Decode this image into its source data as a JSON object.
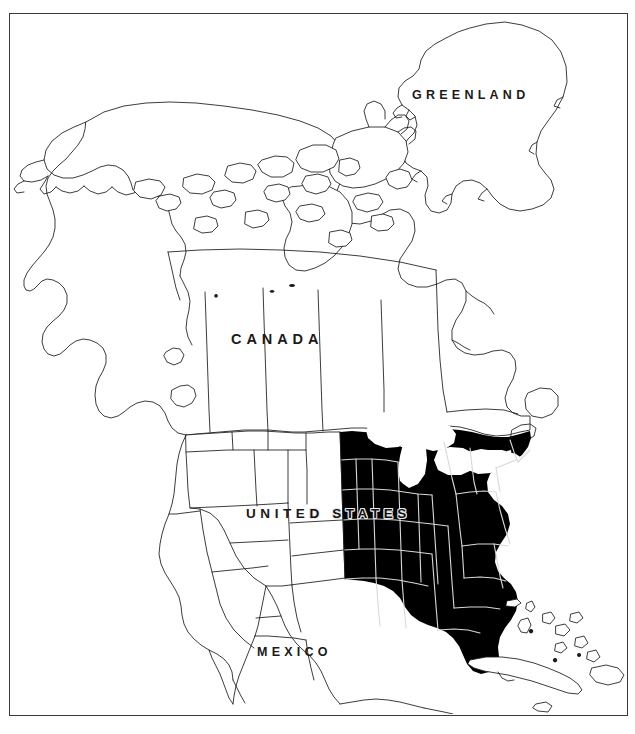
{
  "figure": {
    "kind": "distribution-range-map",
    "background_color": "#ffffff",
    "ink_color": "#1a1a1a",
    "frame": {
      "border_color": "#3a3a3a",
      "border_width_px": 1.6,
      "x": 9,
      "y": 13,
      "width": 619,
      "height": 703
    }
  },
  "labels": {
    "greenland": "GREENLAND",
    "canada": "CANADA",
    "mexico": "MEXICO",
    "united_states_full": "UNITED STATES",
    "united_states_left": "UNITE",
    "united_states_right": "D STATES"
  },
  "legend": {
    "shaded_fill_color": "#000000",
    "shaded_meaning": "range / distribution area",
    "unshaded_fill_color": "#ffffff",
    "boundary_line_color": "#1a1a1a"
  },
  "map_data": {
    "projection": "conic",
    "countries_outlined": [
      "Canada",
      "United States",
      "Mexico",
      "Greenland",
      "Cuba",
      "Bahamas"
    ],
    "internal_boundaries": [
      "Canadian provinces",
      "United States states",
      "Mexican northern states"
    ],
    "shaded_region_description": "Eastern and south-central United States, solid black",
    "shaded_states": [
      "Maine",
      "New Hampshire",
      "Vermont",
      "Massachusetts",
      "Rhode Island",
      "Connecticut",
      "New York",
      "New Jersey",
      "Pennsylvania",
      "Delaware",
      "Maryland",
      "Virginia",
      "West Virginia",
      "North Carolina",
      "South Carolina",
      "Georgia",
      "Florida",
      "Alabama",
      "Mississippi",
      "Tennessee",
      "Kentucky",
      "Ohio",
      "Indiana",
      "Illinois",
      "Wisconsin",
      "Iowa",
      "Missouri",
      "Arkansas",
      "Louisiana",
      "Texas",
      "Oklahoma"
    ],
    "unshaded_states": [
      "Alaska",
      "Washington",
      "Oregon",
      "California",
      "Nevada",
      "Idaho",
      "Montana",
      "Wyoming",
      "Utah",
      "Arizona",
      "Colorado",
      "New Mexico",
      "North Dakota",
      "South Dakota",
      "Nebraska",
      "Kansas",
      "Minnesota",
      "Michigan"
    ],
    "water_features": [
      "Hudson Bay",
      "Great Lakes",
      "Gulf of Mexico",
      "Atlantic Ocean",
      "Pacific Ocean",
      "Caribbean Sea"
    ]
  }
}
